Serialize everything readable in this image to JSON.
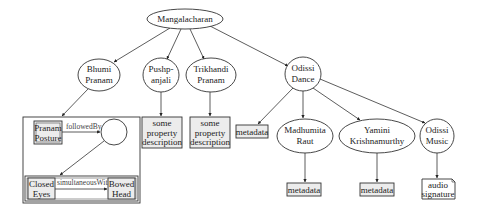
{
  "diagram": {
    "root": {
      "label": "Mangalacharan"
    },
    "nodes": {
      "bhumi_pranam": {
        "line1": "Bhumi",
        "line2": "Pranam"
      },
      "pushpanjali": {
        "line1": "Pushp-",
        "line2": "anjali"
      },
      "trikhandi_pranam": {
        "line1": "Trikhandi",
        "line2": "Pranam"
      },
      "odissi_dance": {
        "line1": "Odissi",
        "line2": "Dance"
      },
      "madhumita_raut": {
        "line1": "Madhumita",
        "line2": "Raut"
      },
      "yamini_krishnamurthy": {
        "line1": "Yamini",
        "line2": "Krishnamurthy"
      },
      "odissi_music": {
        "line1": "Odissi",
        "line2": "Music"
      }
    },
    "property_boxes": {
      "pushpanjali_desc": {
        "line1": "some",
        "line2": "property",
        "line3": "description"
      },
      "trikhandi_desc": {
        "line1": "some",
        "line2": "property",
        "line3": "description"
      }
    },
    "metadata_boxes": {
      "odissi_dance_metadata": "metadata",
      "madhumita_metadata": "metadata",
      "yamini_metadata": "metadata"
    },
    "audio_box": {
      "line1": "audio",
      "line2": "signature"
    },
    "composite": {
      "pranam_posture": {
        "line1": "Pranam",
        "line2": "Posture"
      },
      "followed_by_label": "followedBy",
      "closed_eyes": {
        "line1": "Closed",
        "line2": "Eyes"
      },
      "simultaneous_label": "simultaneousWith",
      "bowed_head": {
        "line1": "Bowed",
        "line2": "Head"
      }
    },
    "colors": {
      "stroke": "#333333",
      "box_fill": "#ececec",
      "node_fill": "#ffffff",
      "label_text": "#444444"
    }
  }
}
